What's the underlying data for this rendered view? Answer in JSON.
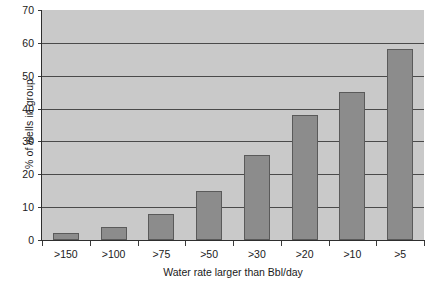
{
  "chart_data": {
    "type": "bar",
    "title": "",
    "xlabel": "Water rate larger than Bbl/day",
    "ylabel": "% of wells in group",
    "categories": [
      ">150",
      ">100",
      ">75",
      ">50",
      ">30",
      ">20",
      ">10",
      ">5"
    ],
    "values": [
      2,
      4,
      8,
      15,
      26,
      38,
      45,
      58
    ],
    "series": [
      {
        "name": "% of wells in group",
        "values": [
          2,
          4,
          8,
          15,
          26,
          38,
          45,
          58
        ]
      }
    ],
    "ylim": [
      0,
      70
    ],
    "ytick_labels": [
      "0",
      "10",
      "20",
      "30",
      "40",
      "50",
      "60",
      "70"
    ],
    "ytick_values": [
      0,
      10,
      20,
      30,
      40,
      50,
      60,
      70
    ],
    "grid": true,
    "legend": "none",
    "colors": {
      "bar_fill": "#8c8c8c",
      "bar_stroke": "#5a5a5a",
      "plot_background": "#c9c9c9",
      "gridline": "#4a4a4a",
      "axis": "#2e2e2e",
      "page_background": "#ffffff",
      "text": "#1a1a1a"
    }
  }
}
